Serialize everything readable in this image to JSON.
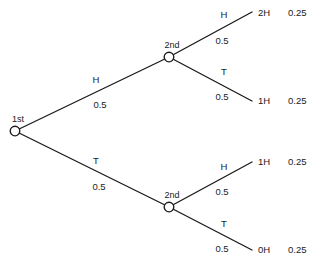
{
  "chart_data": {
    "type": "diagram",
    "root": {
      "label": "1st",
      "x": 15,
      "y": 131
    },
    "nodes": [
      {
        "label": "2nd",
        "x": 169,
        "y": 57
      },
      {
        "label": "2nd",
        "x": 169,
        "y": 207
      }
    ],
    "stage1_branches": [
      {
        "outcome": "H",
        "probability": "0.5",
        "from": {
          "x": 15,
          "y": 131
        },
        "to": {
          "x": 169,
          "y": 57
        },
        "outcome_pos": {
          "x": 96,
          "y": 83
        },
        "prob_pos": {
          "x": 100,
          "y": 108
        }
      },
      {
        "outcome": "T",
        "probability": "0.5",
        "from": {
          "x": 15,
          "y": 131
        },
        "to": {
          "x": 169,
          "y": 207
        },
        "outcome_pos": {
          "x": 96,
          "y": 164
        },
        "prob_pos": {
          "x": 99,
          "y": 190
        }
      }
    ],
    "stage2_branches": [
      {
        "outcome": "H",
        "probability": "0.5",
        "from": {
          "x": 169,
          "y": 57
        },
        "to": {
          "x": 252,
          "y": 12
        },
        "outcome_pos": {
          "x": 224,
          "y": 18
        },
        "prob_pos": {
          "x": 222,
          "y": 44
        }
      },
      {
        "outcome": "T",
        "probability": "0.5",
        "from": {
          "x": 169,
          "y": 57
        },
        "to": {
          "x": 252,
          "y": 101
        },
        "outcome_pos": {
          "x": 224,
          "y": 75
        },
        "prob_pos": {
          "x": 222,
          "y": 100
        }
      },
      {
        "outcome": "H",
        "probability": "0.5",
        "from": {
          "x": 169,
          "y": 207
        },
        "to": {
          "x": 252,
          "y": 162
        },
        "outcome_pos": {
          "x": 224,
          "y": 170
        },
        "prob_pos": {
          "x": 222,
          "y": 195
        }
      },
      {
        "outcome": "T",
        "probability": "0.5",
        "from": {
          "x": 169,
          "y": 207
        },
        "to": {
          "x": 252,
          "y": 250
        },
        "outcome_pos": {
          "x": 224,
          "y": 227
        },
        "prob_pos": {
          "x": 222,
          "y": 252
        }
      }
    ],
    "results": [
      {
        "label": "2H",
        "probability": "0.25",
        "y": 16,
        "label_x": 258,
        "prob_x": 288
      },
      {
        "label": "1H",
        "probability": "0.25",
        "y": 104,
        "label_x": 258,
        "prob_x": 288
      },
      {
        "label": "1H",
        "probability": "0.25",
        "y": 165,
        "label_x": 258,
        "prob_x": 288
      },
      {
        "label": "0H",
        "probability": "0.25",
        "y": 253,
        "label_x": 258,
        "prob_x": 288
      }
    ],
    "node_radius": 4.8,
    "stroke_color": "#1b1b1b",
    "background_color": "#ffffff"
  }
}
